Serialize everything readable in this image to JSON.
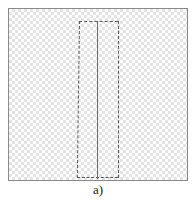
{
  "figure": {
    "caption": "a)",
    "panel_label": "a)",
    "frame": {
      "name": "domain-frame",
      "border_color": "#8a8a8a",
      "fill_description": "light gray checkerboard mesh hatch",
      "fill_light": "#ffffff",
      "fill_dark": "#dcdcdc",
      "x": 8,
      "y": 8,
      "width": 180,
      "height": 173
    },
    "subdomain": {
      "name": "dashed-subdomain",
      "line_style": "dashed",
      "line_color": "#555555",
      "x": 68,
      "y": 12,
      "width": 41,
      "height": 157
    },
    "center_line": {
      "name": "center-line",
      "line_style": "solid",
      "line_color": "#6d6d6d",
      "x": 88,
      "y": 12,
      "length": 158
    }
  },
  "colors": {
    "background": "#ffffff",
    "frame_border": "#8a8a8a",
    "mesh_gray": "#dcdcdc",
    "dashed_line": "#555555",
    "solid_line": "#6d6d6d",
    "caption_text": "#1a1a1a"
  }
}
